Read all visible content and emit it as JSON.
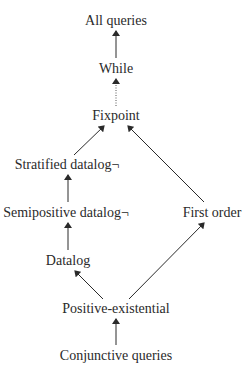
{
  "diagram": {
    "nodes": [
      {
        "id": "all",
        "label": "All queries",
        "x": 116,
        "y": 21
      },
      {
        "id": "while",
        "label": "While",
        "x": 116,
        "y": 69
      },
      {
        "id": "fixpoint",
        "label": "Fixpoint",
        "x": 116,
        "y": 116
      },
      {
        "id": "stratified",
        "label": "Stratified datalog¬",
        "x": 67,
        "y": 165
      },
      {
        "id": "semipositive",
        "label": "Semipositive datalog¬",
        "x": 66,
        "y": 213
      },
      {
        "id": "firstorder",
        "label": "First order",
        "x": 212,
        "y": 213
      },
      {
        "id": "datalog",
        "label": "Datalog",
        "x": 68,
        "y": 261
      },
      {
        "id": "posex",
        "label": "Positive-existential",
        "x": 116,
        "y": 309
      },
      {
        "id": "conj",
        "label": "Conjunctive queries",
        "x": 116,
        "y": 356
      }
    ],
    "edges": [
      {
        "from": "while",
        "to": "all",
        "style": "solid"
      },
      {
        "from": "fixpoint",
        "to": "while",
        "style": "dotted"
      },
      {
        "from": "stratified",
        "to": "fixpoint",
        "style": "solid"
      },
      {
        "from": "firstorder",
        "to": "fixpoint",
        "style": "solid"
      },
      {
        "from": "semipositive",
        "to": "stratified",
        "style": "solid"
      },
      {
        "from": "datalog",
        "to": "semipositive",
        "style": "solid"
      },
      {
        "from": "posex",
        "to": "datalog",
        "style": "solid"
      },
      {
        "from": "posex",
        "to": "firstorder",
        "style": "solid"
      },
      {
        "from": "conj",
        "to": "posex",
        "style": "solid"
      }
    ]
  }
}
